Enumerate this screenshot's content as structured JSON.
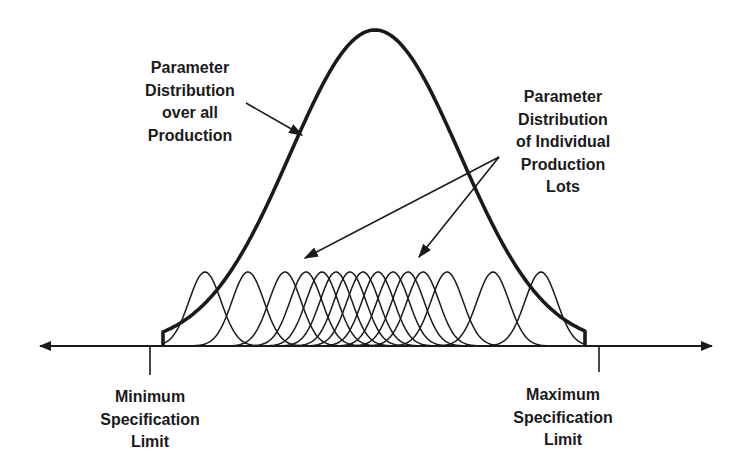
{
  "diagram": {
    "colors": {
      "ink": "#1a1a1a",
      "background": "#ffffff"
    },
    "labels": {
      "overall": {
        "lines": [
          "Parameter",
          "Distribution",
          "over all",
          "Production"
        ]
      },
      "lots": {
        "lines": [
          "Parameter",
          "Distribution",
          "of Individual",
          "Production",
          "Lots"
        ]
      },
      "min_spec": {
        "lines": [
          "Minimum",
          "Specification",
          "Limit"
        ]
      },
      "max_spec": {
        "lines": [
          "Maximum",
          "Specification",
          "Limit"
        ]
      }
    },
    "geometry": {
      "axis": {
        "y": 346,
        "x_start": 40,
        "x_end": 712
      },
      "min_tick_x": 150,
      "max_tick_x": 599,
      "overall_curve": {
        "mean_x": 375,
        "peak_y": 30,
        "sigma": 85,
        "cut_left_x": 163,
        "cut_right_x": 585
      },
      "lot_curves": {
        "peak_y": 272,
        "sigma": 16,
        "peaks_x": [
          205,
          248,
          285,
          306,
          322,
          336,
          350,
          363,
          378,
          393,
          408,
          423,
          447,
          493,
          541
        ]
      },
      "arrows": {
        "overall": {
          "from": [
            246,
            103
          ],
          "to": [
            302,
            135
          ]
        },
        "lots": [
          {
            "from": [
              499,
              157
            ],
            "to": [
              305,
              258
            ]
          },
          {
            "from": [
              499,
              157
            ],
            "to": [
              419,
              257
            ]
          }
        ]
      }
    }
  }
}
